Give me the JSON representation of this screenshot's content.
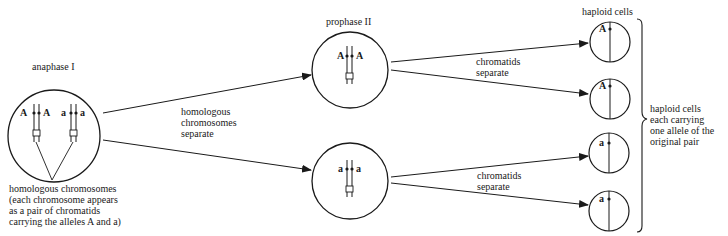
{
  "stages": {
    "anaphase_I": {
      "title": "anaphase I",
      "alleles": [
        "A",
        "A",
        "a",
        "a"
      ]
    },
    "prophase_II_top": {
      "title": "prophase II",
      "alleles": [
        "A",
        "A"
      ]
    },
    "prophase_II_bottom": {
      "alleles": [
        "a",
        "a"
      ]
    },
    "haploid": {
      "title": "haploid cells",
      "cells": [
        {
          "allele": "A"
        },
        {
          "allele": "A"
        },
        {
          "allele": "a"
        },
        {
          "allele": "a"
        }
      ]
    }
  },
  "annotations": {
    "homologous_separate": [
      "homologous",
      "chromosomes",
      "separate"
    ],
    "chromatids_separate_top": [
      "chromatids",
      "separate"
    ],
    "chromatids_separate_bottom": [
      "chromatids",
      "separate"
    ],
    "homologous_note": [
      "homologous chromosomes",
      "(each chromosome appears",
      "as a pair of chromatids",
      "carrying the alleles A and a)"
    ],
    "haploid_note": [
      "haploid cells",
      "each carrying",
      "one allele of the",
      "original pair"
    ]
  }
}
